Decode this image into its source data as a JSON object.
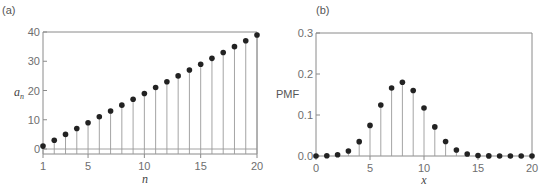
{
  "chart_data": [
    {
      "type": "stem",
      "panel_label": "(a)",
      "title": "",
      "xlabel": "n",
      "ylabel": "a_n",
      "ylabel_main": "a",
      "ylabel_sub": "n",
      "xlim": [
        1,
        20
      ],
      "ylim": [
        0,
        40
      ],
      "xticks": [
        1,
        5,
        10,
        15,
        20
      ],
      "yticks": [
        0,
        10,
        20,
        30,
        40
      ],
      "grid": false,
      "x": [
        1,
        2,
        3,
        4,
        5,
        6,
        7,
        8,
        9,
        10,
        11,
        12,
        13,
        14,
        15,
        16,
        17,
        18,
        19,
        20
      ],
      "values": [
        1,
        3,
        5,
        7,
        9,
        11,
        13,
        15,
        17,
        19,
        21,
        23,
        25,
        27,
        29,
        31,
        33,
        35,
        37,
        39
      ]
    },
    {
      "type": "stem",
      "panel_label": "(b)",
      "title": "",
      "xlabel": "x",
      "ylabel": "PMF",
      "xlim": [
        0,
        20
      ],
      "ylim": [
        0,
        0.3
      ],
      "xticks": [
        0,
        5,
        10,
        15,
        20
      ],
      "yticks": [
        "0.0",
        "0.1",
        "0.2",
        "0.3"
      ],
      "grid": false,
      "x": [
        0,
        1,
        2,
        3,
        4,
        5,
        6,
        7,
        8,
        9,
        10,
        11,
        12,
        13,
        14,
        15,
        16,
        17,
        18,
        19,
        20
      ],
      "values": [
        0.0,
        0.0005,
        0.0031,
        0.0123,
        0.035,
        0.0746,
        0.1244,
        0.1659,
        0.1797,
        0.1597,
        0.1171,
        0.071,
        0.0355,
        0.0146,
        0.0049,
        0.0013,
        0.0003,
        0.0,
        0.0,
        0.0,
        0.0
      ]
    }
  ],
  "colors": {
    "marker": "#222222",
    "stem": "#9a9a9a",
    "axis": "#8a8a8a",
    "text": "#6e6e6e"
  }
}
